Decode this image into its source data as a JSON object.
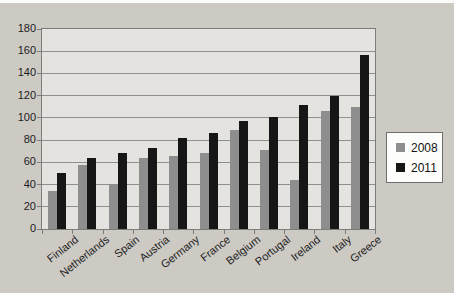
{
  "chart_data": {
    "type": "bar",
    "title": "",
    "xlabel": "",
    "ylabel": "",
    "categories": [
      "Finland",
      "Netherlands",
      "Spain",
      "Austria",
      "Germany",
      "France",
      "Belgium",
      "Portugal",
      "Ireland",
      "Italy",
      "Greece"
    ],
    "series": [
      {
        "name": "2008",
        "color": "#8e8e8e",
        "values": [
          34,
          58,
          40,
          64,
          66,
          68,
          89,
          71,
          44,
          106,
          110
        ]
      },
      {
        "name": "2011",
        "color": "#161616",
        "values": [
          50,
          64,
          68,
          73,
          82,
          86,
          97,
          101,
          112,
          120,
          157
        ]
      }
    ],
    "ylim": [
      0,
      180
    ],
    "yticks": [
      0,
      20,
      40,
      60,
      80,
      100,
      120,
      140,
      160,
      180
    ],
    "grid": "horizontal",
    "legend_position": "right",
    "x_label_rotation_deg": -38
  },
  "colors": {
    "plot_background": "#e4e3df",
    "page_background": "#cdcac4",
    "gridline": "#8f8f8d",
    "axis_text": "#1b1b1b"
  }
}
